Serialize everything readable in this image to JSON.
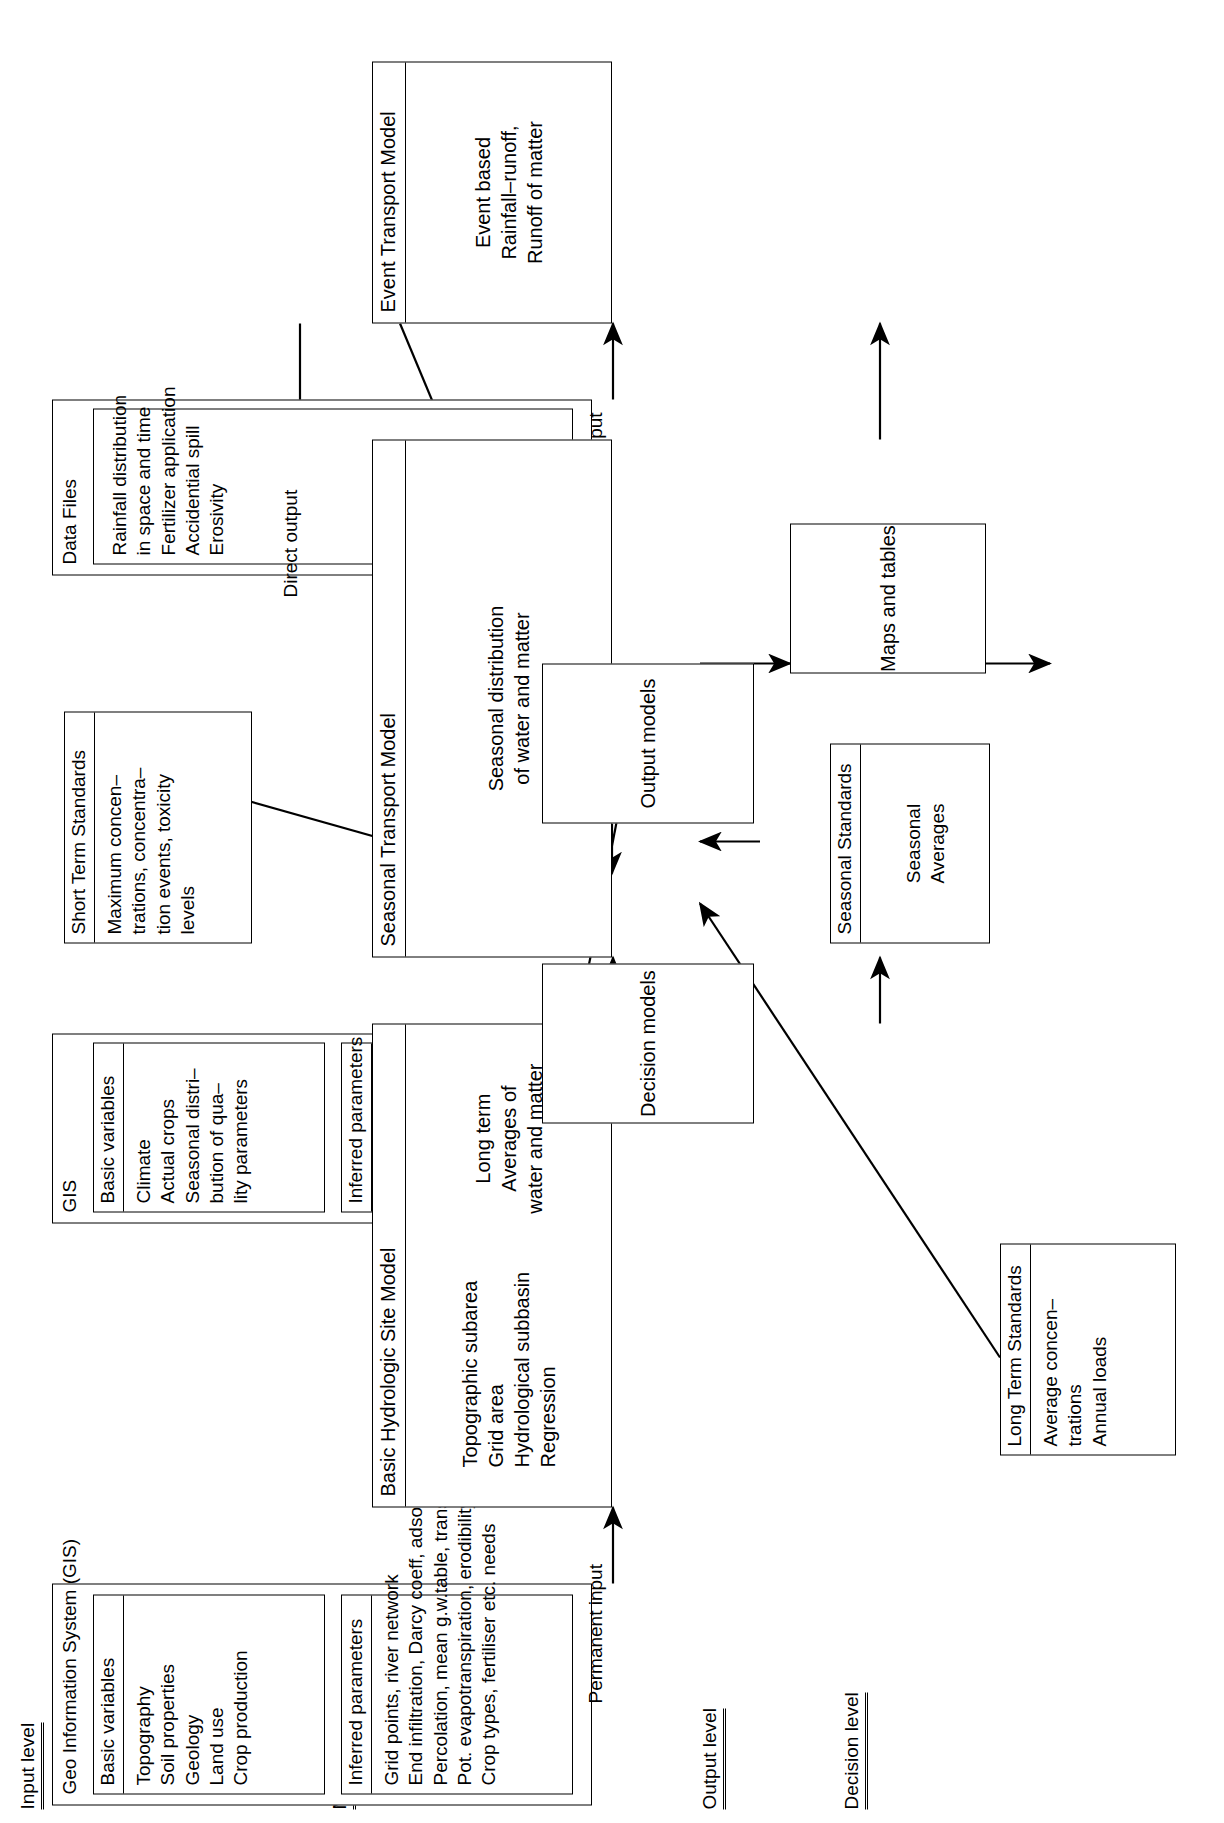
{
  "figure": {
    "orientation_deg": -90
  },
  "levels": [
    {
      "id": "input",
      "label": "Input level"
    },
    {
      "id": "model",
      "label": "Model level"
    },
    {
      "id": "output",
      "label": "Output level"
    },
    {
      "id": "decision",
      "label": "Decision level"
    }
  ],
  "input_level": {
    "gis_permanent": {
      "outer_title": "Geo Information System (GIS)",
      "basic": {
        "header": "Basic variables",
        "items": [
          "Topography",
          "Soil properties",
          "Geology",
          "Land use",
          "Crop production"
        ]
      },
      "inferred": {
        "header": "Inferred parameters",
        "items": [
          "Grid points, river network",
          "End infiltration, Darcy coeff, adsorptivity",
          "Percolation, mean g.w.table, transmissivity",
          "Pot. evapotranspiration, erodibility",
          "Crop types, fertiliser etc. needs"
        ]
      },
      "edge_label": "Permanent input"
    },
    "gis_seasonal": {
      "outer_title": "GIS",
      "basic": {
        "header": "Basic variables",
        "items": [
          "Climate",
          "Actual crops",
          "Seasonal distri–",
          "bution of qua–",
          "lity parameters"
        ]
      },
      "inferred": {
        "header": "Inferred parameters",
        "items": [
          "T(t), factors",
          "ET(t)"
        ]
      },
      "edge_label": "Seasonal input"
    },
    "data_files": {
      "outer_title": "Data Files",
      "panel": {
        "header": "",
        "items": [
          "Rainfall distribution",
          "in space and time",
          "Fertilizer application",
          "Accidential spill",
          "Erosivity"
        ]
      },
      "edge_label": "Event input"
    }
  },
  "model_level": {
    "basic_hydrologic": {
      "header": "Basic Hydrologic Site Model",
      "left_items": [
        "Topographic subarea",
        "Grid area",
        "Hydrological subbasin",
        "Regression"
      ],
      "right_items": [
        "Long term",
        "Averages of",
        "water and matter"
      ]
    },
    "seasonal_transport": {
      "header": "Seasonal Transport Model",
      "body": [
        "Seasonal distribution",
        "of water and matter"
      ]
    },
    "event_transport": {
      "header": "Event Transport Model",
      "body": [
        "Event based",
        "Rainfall–runoff,",
        "Runoff of matter"
      ]
    }
  },
  "output_level": {
    "output_models": {
      "label": "Output models"
    },
    "maps_tables": {
      "label": "Maps and tables"
    },
    "direct_output_label": "Direct output"
  },
  "decision_level": {
    "decision_models": {
      "label": "Decision models"
    },
    "short_term": {
      "header": "Short Term Standards",
      "items": [
        "Maximum concen–",
        "trations, concentra–",
        "tion events, toxicity",
        "levels"
      ]
    },
    "seasonal": {
      "header": "Seasonal Standards",
      "items": [
        "Seasonal",
        "Averages"
      ]
    },
    "long_term": {
      "header": "Long Term Standards",
      "items": [
        "Average concen–",
        "trations",
        "Annual loads"
      ]
    }
  },
  "colors": {
    "stroke": "#000000",
    "background": "#ffffff"
  }
}
